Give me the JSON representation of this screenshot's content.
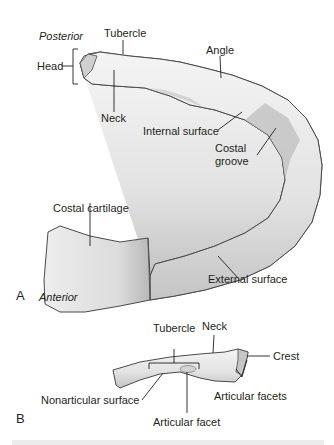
{
  "figure_a": {
    "panel_letter": "A",
    "orientation_posterior": "Posterior",
    "orientation_anterior": "Anterior",
    "labels": {
      "tubercle": "Tubercle",
      "head": "Head",
      "neck": "Neck",
      "angle": "Angle",
      "internal_surface": "Internal surface",
      "costal_groove_line1": "Costal",
      "costal_groove_line2": "groove",
      "costal_cartilage": "Costal cartilage",
      "external_surface": "External surface"
    }
  },
  "figure_b": {
    "panel_letter": "B",
    "labels": {
      "tubercle": "Tubercle",
      "neck": "Neck",
      "crest": "Crest",
      "nonarticular_surface": "Nonarticular surface",
      "articular_facet": "Articular facet",
      "articular_facets": "Articular facets"
    }
  },
  "colors": {
    "bone_fill": "#e6e6e6",
    "bone_shade": "#bdbdbd",
    "outline": "#4a4a4a",
    "text": "#231f20"
  }
}
